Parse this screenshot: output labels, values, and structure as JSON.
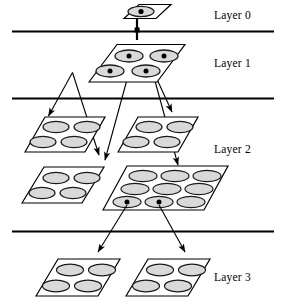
{
  "diagram": {
    "colors": {
      "background": "#ffffff",
      "stroke": "#000000",
      "ellipse_fill": "#d9d9d9",
      "ellipse_stroke": "#1a1a1a",
      "plane_fill": "#ffffff",
      "divider": "#000000",
      "dot": "#000000"
    },
    "dividers": [
      {
        "name": "divider-layer0-layer1",
        "y": 31
      },
      {
        "name": "divider-layer1-layer2",
        "y": 98
      },
      {
        "name": "divider-layer2-layer3",
        "y": 231
      }
    ],
    "labels": [
      {
        "id": "layer-0",
        "text": "Layer 0"
      },
      {
        "id": "layer-1",
        "text": "Layer 1"
      },
      {
        "id": "layer-2",
        "text": "Layer 2"
      },
      {
        "id": "layer-3",
        "text": "Layer 3"
      }
    ],
    "planes": [
      {
        "id": "plane-layer0",
        "layer": "Layer 0",
        "cells": 1,
        "grid": "1x1",
        "marked_cells": 1,
        "description": "Single root cell with marker dot"
      },
      {
        "id": "plane-layer1",
        "layer": "Layer 1",
        "cells": 4,
        "grid": "2x2",
        "marked_cells": 4,
        "description": "Four cells, all marked with dots"
      },
      {
        "id": "plane-layer2-upper-left",
        "layer": "Layer 2",
        "cells": 4,
        "grid": "2x2",
        "marked_cells": 0,
        "description": "Upper-left plane, four unmarked cells"
      },
      {
        "id": "plane-layer2-upper-right",
        "layer": "Layer 2",
        "cells": 4,
        "grid": "2x2",
        "marked_cells": 0,
        "description": "Upper-right plane, four unmarked cells"
      },
      {
        "id": "plane-layer2-lower-left",
        "layer": "Layer 2",
        "cells": 4,
        "grid": "2x2",
        "marked_cells": 0,
        "description": "Lower-left plane, four unmarked cells"
      },
      {
        "id": "plane-layer2-lower-right",
        "layer": "Layer 2",
        "cells": 9,
        "grid": "3x3",
        "marked_cells": 2,
        "description": "Lower-right plane, nine cells, two bottom-row cells marked"
      },
      {
        "id": "plane-layer3-left",
        "layer": "Layer 3",
        "cells": 4,
        "grid": "2x2",
        "marked_cells": 0,
        "description": "Left plane, four unmarked cells"
      },
      {
        "id": "plane-layer3-right",
        "layer": "Layer 3",
        "cells": 4,
        "grid": "2x2",
        "marked_cells": 0,
        "description": "Right plane, four unmarked cells"
      }
    ],
    "connectors": [
      {
        "id": "stem-layer0-down",
        "type": "stem",
        "from": "plane-layer0",
        "to": "plane-layer1"
      },
      {
        "id": "arrow-l1-left-to-l2-upper-left",
        "type": "arrow",
        "from": "plane-layer1",
        "to": "plane-layer2-upper-left"
      },
      {
        "id": "arrow-l1-left-to-l2-upper-right",
        "type": "arrow",
        "from": "plane-layer1",
        "to": "plane-layer2-upper-right"
      },
      {
        "id": "arrow-l1-right-to-l2-lower-left",
        "type": "arrow",
        "from": "plane-layer1",
        "to": "plane-layer2-lower-left"
      },
      {
        "id": "arrow-l1-right-to-l2-lower-right",
        "type": "arrow",
        "from": "plane-layer1",
        "to": "plane-layer2-lower-right"
      },
      {
        "id": "arrow-l2-to-l3-left",
        "type": "arrow",
        "from": "plane-layer2-lower-right",
        "to": "plane-layer3-left"
      },
      {
        "id": "arrow-l2-to-l3-right",
        "type": "arrow",
        "from": "plane-layer2-lower-right",
        "to": "plane-layer3-right"
      }
    ]
  }
}
